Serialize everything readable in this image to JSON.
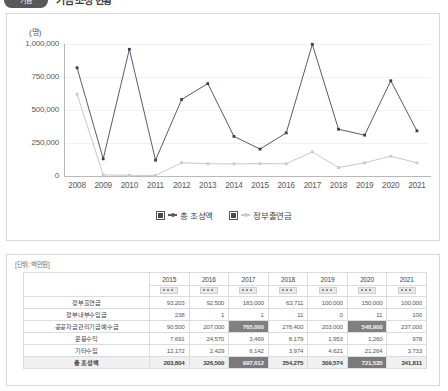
{
  "header": {
    "badge": "기금",
    "title": "기금 조성 현황"
  },
  "chart_card": {
    "y_unit": "(명)"
  },
  "legend": {
    "items": [
      {
        "label": "총 조성액",
        "color": "#5a5a6e",
        "checked": true
      },
      {
        "label": "정부출연금",
        "color": "#c9c9c9",
        "checked": true
      }
    ]
  },
  "chart_data": {
    "type": "line",
    "title": "",
    "xlabel": "",
    "ylabel": "(명)",
    "ylim": [
      0,
      1000000
    ],
    "yticks": [
      0,
      250000,
      500000,
      750000,
      1000000
    ],
    "ytick_labels": [
      "0",
      "250,000",
      "500,000",
      "750,000",
      "1,000,000"
    ],
    "grid": true,
    "legend_position": "bottom",
    "categories": [
      "2008",
      "2009",
      "2010",
      "2011",
      "2012",
      "2013",
      "2014",
      "2015",
      "2016",
      "2017",
      "2018",
      "2019",
      "2020",
      "2021"
    ],
    "series": [
      {
        "name": "총 조성액",
        "color": "#5a5a6e",
        "values": [
          820000,
          130000,
          960000,
          120000,
          580000,
          700000,
          300000,
          203804,
          326500,
          997612,
          354275,
          309574,
          721535,
          341811
        ]
      },
      {
        "name": "정부출연금",
        "color": "#c9c9c9",
        "values": [
          620000,
          8000,
          5000,
          5000,
          100000,
          93000,
          92000,
          93203,
          92500,
          183000,
          63711,
          100000,
          150000,
          100000
        ]
      }
    ]
  },
  "table": {
    "unit_note": "[단위: 백만원]",
    "corner_label": "",
    "years": [
      "2015",
      "2016",
      "2017",
      "2018",
      "2019",
      "2020",
      "2021"
    ],
    "rows": [
      {
        "label": "정부출연금",
        "values": [
          "93,203",
          "92,500",
          "183,000",
          "63,711",
          "100,000",
          "150,000",
          "100,000"
        ],
        "highlight": [
          false,
          false,
          false,
          false,
          false,
          false,
          false
        ]
      },
      {
        "label": "정부내부수입금",
        "values": [
          "238",
          "1",
          "1",
          "11",
          "0",
          "11",
          "100"
        ],
        "highlight": [
          false,
          false,
          false,
          false,
          false,
          false,
          false
        ]
      },
      {
        "label": "공공자금관리기금예수금",
        "values": [
          "90,500",
          "207,000",
          "765,000",
          "278,400",
          "203,000",
          "548,900",
          "237,000"
        ],
        "highlight": [
          false,
          false,
          true,
          false,
          false,
          true,
          false
        ]
      },
      {
        "label": "운용수익",
        "values": [
          "7,691",
          "24,570",
          "3,469",
          "8,179",
          "1,953",
          "1,260",
          "978"
        ],
        "highlight": [
          false,
          false,
          false,
          false,
          false,
          false,
          false
        ]
      },
      {
        "label": "기타수입",
        "values": [
          "12,172",
          "2,429",
          "6,142",
          "3,974",
          "4,621",
          "21,264",
          "3,733"
        ],
        "highlight": [
          false,
          false,
          false,
          false,
          false,
          false,
          false
        ]
      },
      {
        "label": "총 조성액",
        "values": [
          "203,804",
          "326,500",
          "997,612",
          "354,275",
          "309,574",
          "721,535",
          "341,811"
        ],
        "highlight": [
          false,
          false,
          true,
          false,
          false,
          true,
          false
        ],
        "is_total": true
      }
    ]
  }
}
